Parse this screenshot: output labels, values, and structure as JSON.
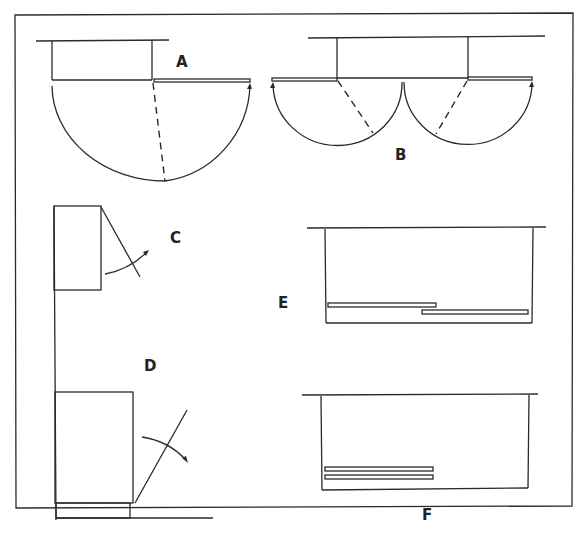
{
  "diagram": {
    "frame_color": "#2a2a2a",
    "background": "#ffffff",
    "labels": {
      "A": "A",
      "B": "B",
      "C": "C",
      "D": "D",
      "E": "E",
      "F": "F"
    },
    "items": [
      {
        "id": "A",
        "type": "single hinged door with 180° swing arc"
      },
      {
        "id": "B",
        "type": "pair of hinged doors with swing arcs"
      },
      {
        "id": "C",
        "type": "wall-mounted cabinet with door angled open"
      },
      {
        "id": "D",
        "type": "base cabinet on plinth with door angled open"
      },
      {
        "id": "E",
        "type": "cabinet with offset sliding doors"
      },
      {
        "id": "F",
        "type": "cabinet with stacked sliding doors"
      }
    ]
  }
}
